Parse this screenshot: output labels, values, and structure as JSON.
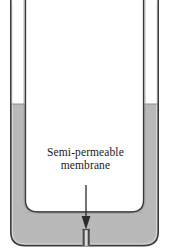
{
  "figure": {
    "type": "osmosis-u-tube-diagram",
    "annotation": {
      "line1": "Semi-permeable",
      "line2": "membrane",
      "pointer": "down-arrow"
    },
    "top_clipped_artifact": "o"
  },
  "colors": {
    "liquid": "#b9b9b9",
    "liquid_shadow": "#a9a9a9",
    "wall_stroke": "#3a3a3a",
    "wall_stroke_light": "#8d8d8d",
    "interior": "#ffffff",
    "membrane_dark": "#4a4a4a",
    "membrane_light": "#d8d8d8",
    "arrow": "#2b2b2b",
    "text": "#1a1a1a",
    "background": "#ffffff"
  },
  "geometry": {
    "canvas_width": 171,
    "canvas_height": 249,
    "left_tube_outer_x": 10,
    "left_tube_inner_x": 25,
    "right_tube_inner_x": 143,
    "right_tube_outer_x": 158,
    "liquid_level_y": 104,
    "inner_floor_y": 212,
    "outer_floor_y": 245,
    "membrane_center_x": 86,
    "membrane_top_y": 229,
    "membrane_bottom_y": 246,
    "arrow_top_y": 185,
    "arrow_tip_y": 228
  },
  "parts": {
    "left_tube": "left-tube",
    "right_tube": "right-tube",
    "u_bend": "u-bend",
    "liquid_left": "liquid-column-left",
    "liquid_right": "liquid-column-right",
    "liquid_bottom": "liquid-bottom",
    "membrane": "semi-permeable-membrane",
    "arrow": "annotation-arrow",
    "interior": "vessel-interior"
  }
}
